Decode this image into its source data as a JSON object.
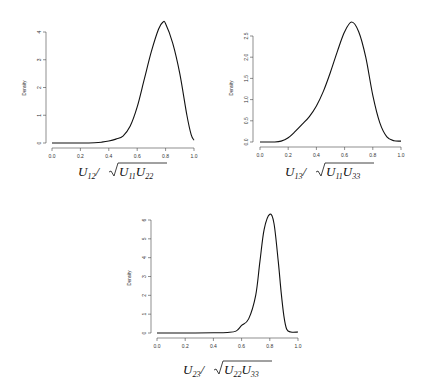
{
  "chart_data": [
    {
      "type": "line",
      "title": "",
      "xlabel": "U12/sqrt(U11 U22)",
      "xlabel_parts": {
        "num": "U",
        "num_sub": "12",
        "den1": "U",
        "den1_sub": "11",
        "den2": "U",
        "den2_sub": "22"
      },
      "ylabel": "Density",
      "xlim": [
        0,
        1
      ],
      "ylim": [
        0,
        4.4
      ],
      "xticks": [
        "0.0",
        "0.2",
        "0.4",
        "0.6",
        "0.8",
        "1.0"
      ],
      "yticks": [
        "0",
        "1",
        "2",
        "3",
        "4"
      ],
      "grid": false,
      "x": [
        0.0,
        0.1,
        0.2,
        0.3,
        0.35,
        0.4,
        0.45,
        0.5,
        0.55,
        0.6,
        0.65,
        0.7,
        0.75,
        0.78,
        0.8,
        0.85,
        0.9,
        0.95,
        0.98,
        1.0
      ],
      "y": [
        0.0,
        0.0,
        0.0,
        0.01,
        0.03,
        0.07,
        0.14,
        0.25,
        0.6,
        1.3,
        2.3,
        3.3,
        4.1,
        4.35,
        4.3,
        3.6,
        2.5,
        1.0,
        0.3,
        0.1
      ]
    },
    {
      "type": "line",
      "title": "",
      "xlabel": "U13/sqrt(U11 U33)",
      "xlabel_parts": {
        "num": "U",
        "num_sub": "13",
        "den1": "U",
        "den1_sub": "11",
        "den2": "U",
        "den2_sub": "33"
      },
      "ylabel": "Density",
      "xlim": [
        0,
        1
      ],
      "ylim": [
        0,
        2.85
      ],
      "xticks": [
        "0.0",
        "0.2",
        "0.4",
        "0.6",
        "0.8",
        "1.0"
      ],
      "yticks": [
        "0.0",
        "0.5",
        "1.0",
        "1.5",
        "2.0",
        "2.5"
      ],
      "grid": false,
      "x": [
        0.0,
        0.1,
        0.15,
        0.2,
        0.25,
        0.3,
        0.35,
        0.4,
        0.45,
        0.5,
        0.55,
        0.6,
        0.65,
        0.7,
        0.75,
        0.8,
        0.85,
        0.9,
        0.95,
        1.0
      ],
      "y": [
        0.0,
        0.0,
        0.02,
        0.1,
        0.25,
        0.42,
        0.6,
        0.85,
        1.2,
        1.65,
        2.15,
        2.6,
        2.83,
        2.6,
        2.0,
        1.1,
        0.45,
        0.12,
        0.03,
        0.02
      ]
    },
    {
      "type": "line",
      "title": "",
      "xlabel": "U23/sqrt(U22 U33)",
      "xlabel_parts": {
        "num": "U",
        "num_sub": "23",
        "den1": "U",
        "den1_sub": "22",
        "den2": "U",
        "den2_sub": "33"
      },
      "ylabel": "Density",
      "xlim": [
        0,
        1
      ],
      "ylim": [
        0,
        6.3
      ],
      "xticks": [
        "0.0",
        "0.2",
        "0.4",
        "0.6",
        "0.8",
        "1.0"
      ],
      "yticks": [
        "0",
        "1",
        "2",
        "3",
        "4",
        "5",
        "6"
      ],
      "grid": false,
      "x": [
        0.0,
        0.2,
        0.4,
        0.5,
        0.56,
        0.6,
        0.65,
        0.7,
        0.73,
        0.76,
        0.8,
        0.83,
        0.86,
        0.88,
        0.9,
        0.92,
        0.95,
        1.0
      ],
      "y": [
        0.0,
        0.0,
        0.01,
        0.03,
        0.1,
        0.4,
        0.75,
        2.0,
        3.8,
        5.5,
        6.3,
        5.8,
        3.8,
        2.2,
        0.9,
        0.2,
        0.05,
        0.05
      ]
    }
  ],
  "panels": [
    {
      "ylabel": "Density"
    },
    {
      "ylabel": "Density"
    },
    {
      "ylabel": "Density"
    }
  ]
}
